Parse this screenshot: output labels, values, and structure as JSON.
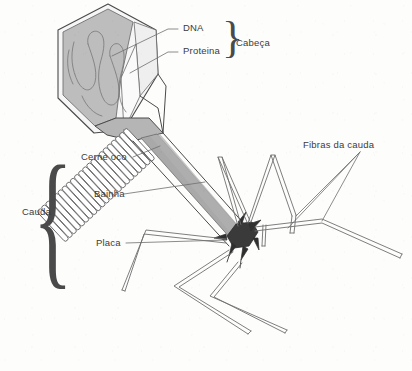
{
  "figure": {
    "language": "pt-BR",
    "background_color": "#fdfdfc",
    "ink_color": "#4a4a4a",
    "label_color": "#3b3b3b"
  },
  "labels": {
    "dna": "DNA",
    "protein": "Proteina",
    "head": "Cabeça",
    "hollow_core": "Cerne oco",
    "sheath": "Bainha",
    "plate": "Placa",
    "tail": "Cauda",
    "tail_fibers": "Fibras da cauda"
  },
  "braces": {
    "head_brace": "}",
    "tail_brace": "{"
  },
  "structures": {
    "capsid": {
      "name": "head-capsid",
      "shape": "hexagonal-prism",
      "fill": "#bdbdbd",
      "cut_away_facet_fill": "#f4f4f4"
    },
    "dna_strand": {
      "name": "dna-strand",
      "shape": "serpentine",
      "stroke": "#8a8a8a",
      "loops": 4
    },
    "sheath": {
      "name": "contractile-sheath",
      "rings": 22,
      "fill": "#ffffff",
      "stroke": "#6b6b6b"
    },
    "core": {
      "name": "hollow-core",
      "fill": "#a9a9a9"
    },
    "baseplate": {
      "name": "baseplate",
      "fill": "#3a3a3a",
      "spikes": 6
    },
    "tail_fibers": {
      "name": "tail-fibers",
      "count": 6,
      "style": "double-line-tube",
      "stroke": "#777777"
    }
  }
}
